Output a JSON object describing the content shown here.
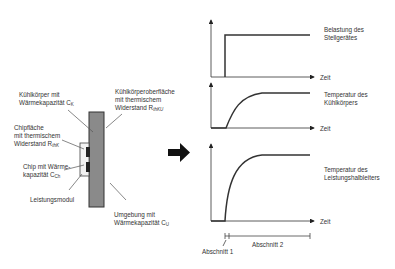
{
  "diagram": {
    "left": {
      "heatsink": {
        "line1": "Kühlkörper mit",
        "line2": "Wärmekapazität C",
        "sub": "K"
      },
      "surface": {
        "line1": "Kühlkörperoberfläche",
        "line2": "mit thermischem",
        "line3": "Widerstand R",
        "sub": "thKU"
      },
      "chipface": {
        "line1": "Chipfläche",
        "line2": "mit thermischem",
        "line3": "Widerstand R",
        "sub": "thK"
      },
      "chip": {
        "line1": "Chip mit Wärme-",
        "line2": "kapazität C",
        "sub": "Ch"
      },
      "module": {
        "line1": "Leistungsmodul"
      },
      "ambient": {
        "line1": "Umgebung mit",
        "line2": "Wärmekapazität C",
        "sub": "U"
      }
    },
    "charts": [
      {
        "label1": "Belastung des",
        "label2": "Stellgerätes",
        "axis": "Zeit"
      },
      {
        "label1": "Temperatur des",
        "label2": "Kühlkörpers",
        "axis": "Zeit"
      },
      {
        "label1": "Temperatur des",
        "label2": "Leistungshalbleiters",
        "axis": "Zeit"
      }
    ],
    "sections": {
      "s1": "Abschnitt 1",
      "s2": "Abschnitt 2"
    }
  }
}
